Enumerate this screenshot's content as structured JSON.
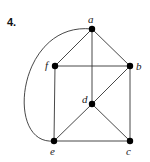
{
  "problem_number": "4.",
  "graph": {
    "nodes": [
      {
        "id": "a",
        "label": "a",
        "x": 92,
        "y": 29,
        "label_x": 88,
        "label_y": 14
      },
      {
        "id": "b",
        "label": "b",
        "x": 130,
        "y": 66,
        "label_x": 136,
        "label_y": 61
      },
      {
        "id": "f",
        "label": "f",
        "x": 55,
        "y": 66,
        "label_x": 45,
        "label_y": 60
      },
      {
        "id": "d",
        "label": "d",
        "x": 92,
        "y": 104,
        "label_x": 82,
        "label_y": 94
      },
      {
        "id": "e",
        "label": "e",
        "x": 54,
        "y": 141,
        "label_x": 50,
        "label_y": 146
      },
      {
        "id": "c",
        "label": "c",
        "x": 130,
        "y": 141,
        "label_x": 126,
        "label_y": 146
      }
    ],
    "edges": [
      {
        "from": "a",
        "to": "f",
        "type": "line"
      },
      {
        "from": "a",
        "to": "b",
        "type": "line"
      },
      {
        "from": "a",
        "to": "d",
        "type": "line"
      },
      {
        "from": "f",
        "to": "b",
        "type": "line"
      },
      {
        "from": "f",
        "to": "e",
        "type": "line"
      },
      {
        "from": "b",
        "to": "d",
        "type": "line"
      },
      {
        "from": "b",
        "to": "c",
        "type": "line"
      },
      {
        "from": "d",
        "to": "e",
        "type": "line"
      },
      {
        "from": "d",
        "to": "c",
        "type": "line"
      },
      {
        "from": "e",
        "to": "c",
        "type": "line"
      },
      {
        "from": "a",
        "to": "e",
        "type": "arc"
      }
    ]
  },
  "colors": {
    "edge": "#333333",
    "node": "#000000",
    "background": "#ffffff"
  }
}
